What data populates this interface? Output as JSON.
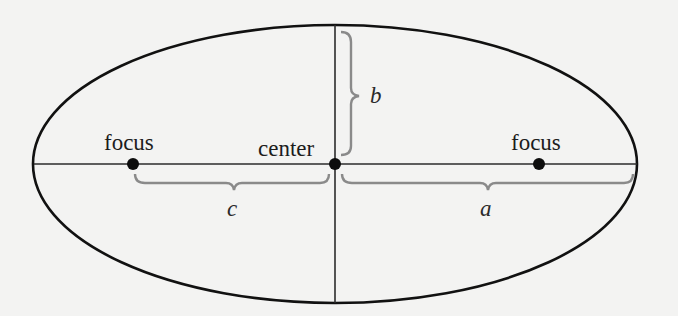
{
  "diagram": {
    "type": "ellipse-anatomy",
    "colors": {
      "background": "#f3f3f2",
      "outline": "#111111",
      "axes": "#2b2b2b",
      "points": "#0d0d0d",
      "braces": "#8a8a8a",
      "text": "#1c1c1c"
    },
    "geometry": {
      "center": [
        334,
        164
      ],
      "rx": 302,
      "ry": 139,
      "focus_left": [
        133,
        164
      ],
      "focus_right": [
        539,
        164
      ]
    },
    "labels": {
      "focus_left": "focus",
      "center": "center",
      "focus_right": "focus",
      "semi_minor": "b",
      "focal_distance": "c",
      "semi_major": "a"
    }
  }
}
